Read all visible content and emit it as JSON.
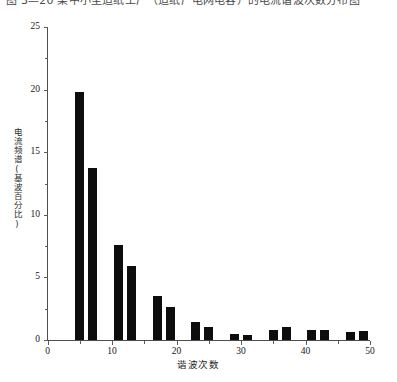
{
  "caption": {
    "text": "图 3—20   某中小型造纸工厂（造纸厂电网电容）的电流谐波次数分布图"
  },
  "chart_data": {
    "type": "bar",
    "title": "",
    "xlabel": "谐波次数",
    "ylabel": "电流频谱(基波百分比)",
    "xlim": [
      0,
      50
    ],
    "ylim": [
      0,
      25
    ],
    "xticks": [
      0,
      10,
      20,
      30,
      40,
      50
    ],
    "yticks": [
      0,
      5,
      10,
      15,
      20,
      25
    ],
    "xtick_labels": [
      "0",
      "10",
      "20",
      "30",
      "40",
      "50"
    ],
    "ytick_labels": [
      "0",
      "5",
      "10",
      "15",
      "20",
      "25"
    ],
    "minor_yticks": [
      2.5,
      7.5,
      12.5,
      17.5,
      22.5
    ],
    "minor_xticks": [
      5,
      15,
      25,
      35,
      45
    ],
    "grid": false,
    "legend": null,
    "bar_color": "#0d0d0d",
    "bar_width": 1.4,
    "categories": [
      5,
      7,
      11,
      13,
      17,
      19,
      23,
      25,
      29,
      31,
      35,
      37,
      41,
      43,
      47,
      49
    ],
    "values": [
      19.8,
      13.7,
      7.6,
      5.9,
      3.5,
      2.6,
      1.4,
      1.0,
      0.45,
      0.4,
      0.8,
      1.0,
      0.8,
      0.8,
      0.65,
      0.7
    ]
  }
}
